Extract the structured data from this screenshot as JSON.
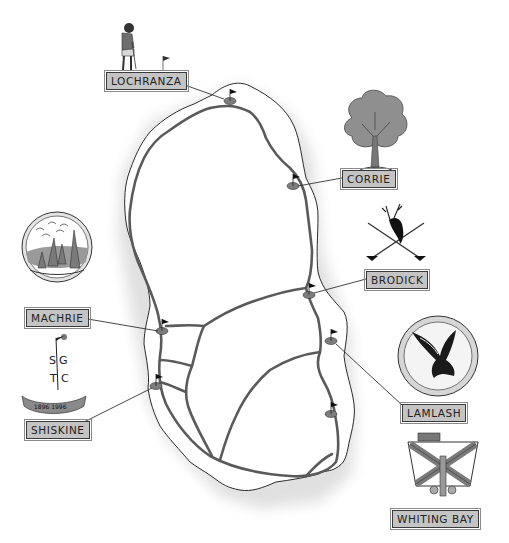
{
  "map": {
    "title": "Isle of Arran Golf Courses",
    "colors": {
      "land": "#ffffff",
      "sea_shading": "#e2e2e2",
      "road": "#555555",
      "green": "#7d7d7d",
      "flag": "#111111",
      "label_fill": "#c4c4c4",
      "label_border": "#3a3a3a"
    },
    "courses": [
      {
        "name": "LOCHRANZA",
        "emblem": "golfer-putting-icon"
      },
      {
        "name": "CORRIE",
        "emblem": "oak-tree-icon"
      },
      {
        "name": "BRODICK",
        "emblem": "stag-head-crossed-clubs-icon"
      },
      {
        "name": "MACHRIE",
        "emblem": "standing-stones-badge-icon"
      },
      {
        "name": "LAMLASH",
        "emblem": "eagle-badge-icon"
      },
      {
        "name": "SHISKINE",
        "emblem": "sgtc-monogram-icon",
        "banner_text": "1896 1996",
        "monogram": [
          "S",
          "G",
          "T",
          "C"
        ]
      },
      {
        "name": "WHITING BAY",
        "emblem": "saltire-shield-ship-icon"
      }
    ]
  }
}
